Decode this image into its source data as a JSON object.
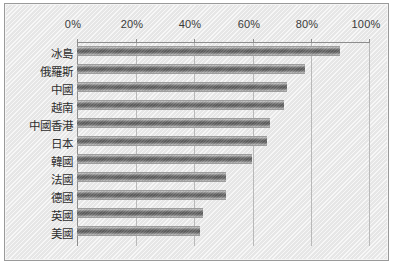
{
  "chart_data": {
    "type": "bar",
    "orientation": "horizontal",
    "title": "",
    "subtitle": "",
    "xlabel": "",
    "ylabel": "",
    "categories": [
      "冰島",
      "俄羅斯",
      "中國",
      "越南",
      "中國香港",
      "日本",
      "韓國",
      "法國",
      "德國",
      "英國",
      "美國"
    ],
    "values": [
      90,
      78,
      72,
      71,
      66,
      65,
      60,
      51,
      51,
      43,
      42
    ],
    "values_display": [
      "90%",
      "78%",
      "72%",
      "71%",
      "66%",
      "65%",
      "60%",
      "51%",
      "51%",
      "43%",
      "42%"
    ],
    "xlim": [
      0,
      100
    ],
    "xticks": [
      0,
      20,
      40,
      60,
      80,
      100
    ],
    "xtick_labels": [
      "0%",
      "20%",
      "40%",
      "60%",
      "80%",
      "100%"
    ],
    "grid": true,
    "grid_axis": "x",
    "legend": null,
    "legend_position": "none",
    "series": [
      {
        "name": "",
        "values": [
          90,
          78,
          72,
          71,
          66,
          65,
          60,
          51,
          51,
          43,
          42
        ]
      }
    ],
    "axis_label_position": "top",
    "bar_color": "#5c5c5c",
    "plot_background": "#ededed",
    "gridline_color": "#b9b9b9",
    "axis_color": "#8d8d8d"
  },
  "frame": {
    "border_color": "#9a9a9a",
    "background": "#ededed"
  }
}
